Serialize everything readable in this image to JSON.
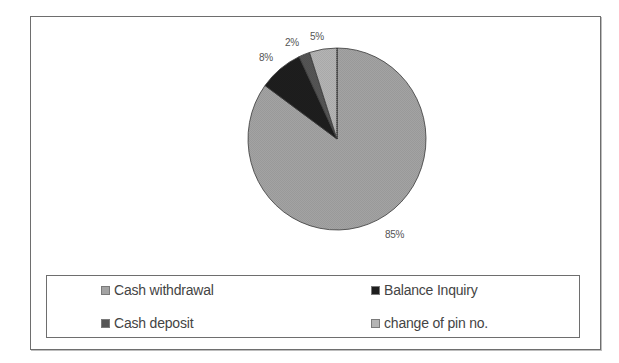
{
  "chart_data": {
    "type": "pie",
    "title": "",
    "categories": [
      "Cash withdrawal",
      "Balance Inquiry",
      "Cash deposit",
      "change of pin no."
    ],
    "values": [
      85,
      8,
      2,
      5
    ],
    "labels": [
      "85%",
      "8%",
      "2%",
      "5%"
    ],
    "colors": [
      "#a3a3a3",
      "#1e1e1e",
      "#555555",
      "#b4b4b4"
    ],
    "start_angle_deg": 0,
    "direction": "clockwise",
    "legend_position": "bottom",
    "legend_columns": 2,
    "grid": false
  },
  "labels": {
    "cash_withdrawal": "85%",
    "balance_inquiry": "8%",
    "cash_deposit": "2%",
    "change_of_pin": "5%"
  },
  "legend": {
    "items": [
      {
        "label": "Cash withdrawal",
        "color": "#a3a3a3"
      },
      {
        "label": "Balance Inquiry",
        "color": "#1e1e1e"
      },
      {
        "label": "Cash deposit",
        "color": "#555555"
      },
      {
        "label": "change of pin no.",
        "color": "#b4b4b4"
      }
    ]
  }
}
